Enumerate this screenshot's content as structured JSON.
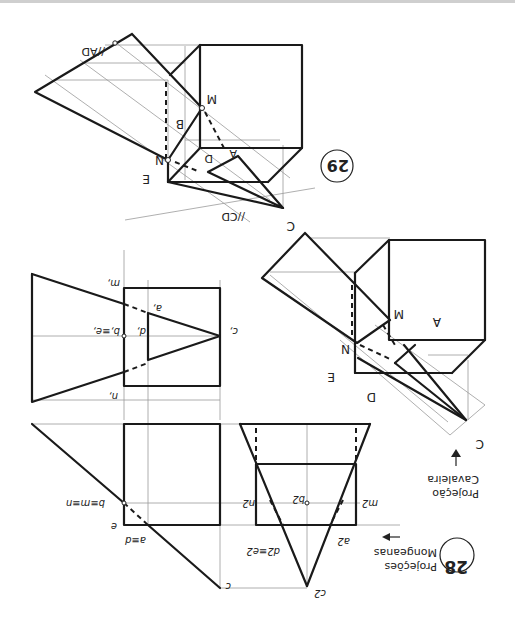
{
  "figure_28": {
    "number": "28",
    "title_line1": "Projeções",
    "title_line2": "Monge­anas",
    "labels": {
      "c1": "c,",
      "a1": "a,",
      "d1": "d,",
      "b1e1": "b,≡e,",
      "m1": "m,",
      "n1": "n,",
      "bmn": "b≡m≡n",
      "e": "e",
      "ad": "a≡d",
      "c": "c",
      "c2": "c2",
      "a2": "a2",
      "d2e2": "d2≡e2",
      "b2": "b2",
      "m2": "m2",
      "n2": "n2"
    }
  },
  "figure_cavaleira": {
    "title_line1": "Projeção",
    "title_line2": "Cavaleira",
    "labels": {
      "C": "C",
      "D": "D",
      "E": "E",
      "N": "N",
      "M": "M",
      "A": "A"
    }
  },
  "figure_29": {
    "number": "29",
    "labels": {
      "C": "C",
      "CD": "//CD",
      "AD": "//AD",
      "E": "E",
      "N": "N",
      "B": "B",
      "M": "M",
      "A": "A",
      "D": "D"
    }
  },
  "colors": {
    "ink": "#1a1a1a",
    "construction": "#9a9a9a",
    "background": "#ffffff"
  }
}
